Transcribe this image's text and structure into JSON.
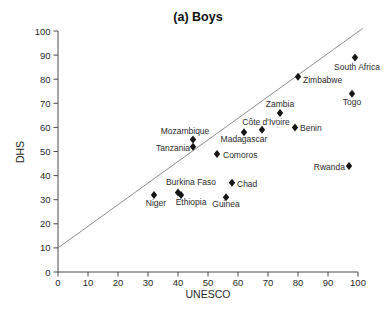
{
  "title": "(a) Boys",
  "colors": {
    "marker": "#161616",
    "reference_line": "#8c8c8c",
    "axis": "#4a4a4a",
    "text": "#2a2a2a",
    "background": "#ffffff"
  },
  "chart_data": {
    "type": "scatter",
    "title": "(a) Boys",
    "xlabel": "UNESCO",
    "ylabel": "DHS",
    "xlim": [
      0,
      100
    ],
    "ylim": [
      0,
      100
    ],
    "xticks": [
      0,
      10,
      20,
      30,
      40,
      50,
      60,
      70,
      80,
      90,
      100
    ],
    "yticks": [
      0,
      10,
      20,
      30,
      40,
      50,
      60,
      70,
      80,
      90,
      100
    ],
    "grid": false,
    "legend": "none",
    "marker": "diamond",
    "reference_line": {
      "x1": 0,
      "y1": 10,
      "x2": 101.5,
      "y2": 101
    },
    "points": [
      {
        "label": "South Africa",
        "x": 99,
        "y": 89,
        "anchor": "middle",
        "dx": 2,
        "dy": 12
      },
      {
        "label": "Zimbabwe",
        "x": 80,
        "y": 81,
        "anchor": "start",
        "dx": 5,
        "dy": 6
      },
      {
        "label": "Togo",
        "x": 98,
        "y": 74,
        "anchor": "middle",
        "dx": 0,
        "dy": 11
      },
      {
        "label": "Zambia",
        "x": 74,
        "y": 66,
        "anchor": "middle",
        "dx": 0,
        "dy": -6
      },
      {
        "label": "Benin",
        "x": 79,
        "y": 60,
        "anchor": "start",
        "dx": 5,
        "dy": 4
      },
      {
        "label": "Côte d'Ivoire",
        "x": 68,
        "y": 59,
        "anchor": "middle",
        "dx": 4,
        "dy": -5
      },
      {
        "label": "Madagascar",
        "x": 62,
        "y": 58,
        "anchor": "middle",
        "dx": 0,
        "dy": 10
      },
      {
        "label": "Mozambique",
        "x": 45,
        "y": 55,
        "anchor": "middle",
        "dx": -8,
        "dy": -5
      },
      {
        "label": "Tanzania",
        "x": 45,
        "y": 52,
        "anchor": "end",
        "dx": -3,
        "dy": 4
      },
      {
        "label": "Comoros",
        "x": 53,
        "y": 49,
        "anchor": "start",
        "dx": 6,
        "dy": 4
      },
      {
        "label": "Rwanda",
        "x": 97,
        "y": 44,
        "anchor": "end",
        "dx": -4,
        "dy": 4
      },
      {
        "label": "Chad",
        "x": 58,
        "y": 37,
        "anchor": "start",
        "dx": 5,
        "dy": 4
      },
      {
        "label": "Burkina Faso",
        "x": 40,
        "y": 33,
        "anchor": "middle",
        "dx": 13,
        "dy": -7
      },
      {
        "label": "Ethiopia",
        "x": 41,
        "y": 32,
        "anchor": "middle",
        "dx": 10,
        "dy": 10
      },
      {
        "label": "Niger",
        "x": 32,
        "y": 32,
        "anchor": "middle",
        "dx": 2,
        "dy": 11
      },
      {
        "label": "Guinea",
        "x": 56,
        "y": 31,
        "anchor": "middle",
        "dx": 0,
        "dy": 10
      }
    ]
  }
}
